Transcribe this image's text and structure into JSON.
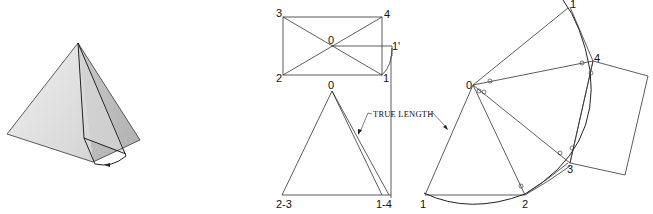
{
  "figure": {
    "panels": [
      "pictorial-pyramid",
      "top-view",
      "front-view",
      "development"
    ]
  },
  "pictorial": {
    "face_light": "#e6e6e6",
    "face_mid": "#cfcfcf",
    "face_dark": "#b8b8b8",
    "edge_color": "#222222"
  },
  "top_view": {
    "labels": {
      "p3": "3",
      "p4": "4",
      "p0": "0",
      "p1prime": "1'",
      "p2": "2",
      "p1": "1"
    }
  },
  "front_view": {
    "labels": {
      "apex": "0",
      "left": "2-3",
      "right": "1-4"
    },
    "callout": "TRUE LENGTH"
  },
  "development": {
    "labels": {
      "apex": "0",
      "p1_top": "1",
      "p4": "4",
      "p3": "3",
      "p2": "2",
      "p1_bottom": "1"
    }
  }
}
